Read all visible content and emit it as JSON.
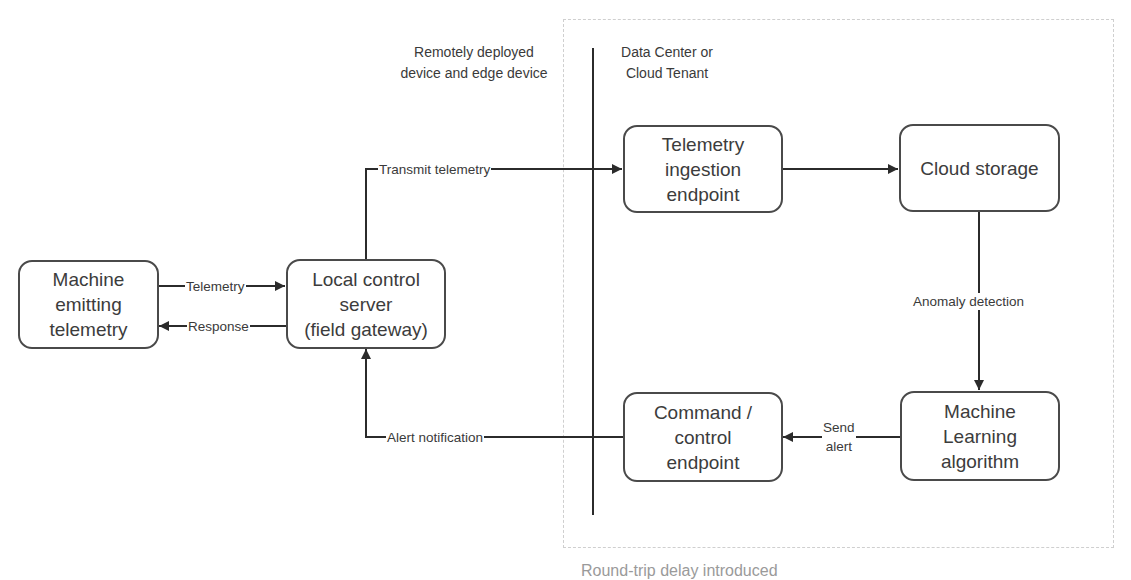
{
  "diagram": {
    "zones": {
      "edge": {
        "label_line1": "Remotely deployed",
        "label_line2": "device and edge device"
      },
      "cloud": {
        "label_line1": "Data Center or",
        "label_line2": "Cloud Tenant"
      }
    },
    "nodes": {
      "machine": {
        "line1": "Machine",
        "line2": "emitting",
        "line3": "telemetry"
      },
      "gateway": {
        "line1": "Local control",
        "line2": "server",
        "line3": "(field gateway)"
      },
      "ingestion": {
        "line1": "Telemetry",
        "line2": "ingestion",
        "line3": "endpoint"
      },
      "storage": {
        "line1": "Cloud storage"
      },
      "command": {
        "line1": "Command /",
        "line2": "control",
        "line3": "endpoint"
      },
      "ml": {
        "line1": "Machine",
        "line2": "Learning",
        "line3": "algorithm"
      }
    },
    "edges": {
      "telemetry": "Telemetry",
      "response": "Response",
      "transmit": "Transmit telemetry",
      "anomaly": "Anomaly detection",
      "send_alert_line1": "Send",
      "send_alert_line2": "alert",
      "alert_notification": "Alert notification"
    },
    "caption": "Round-trip delay introduced",
    "colors": {
      "stroke": "#2b2b2b",
      "node_border": "#4a4a4a",
      "zone_border": "#cfcfcf",
      "caption": "#9a9a9a"
    }
  }
}
